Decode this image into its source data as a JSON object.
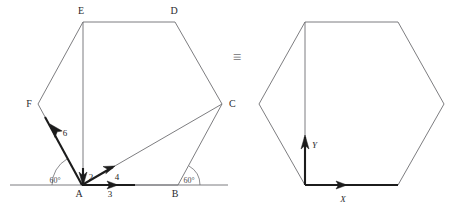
{
  "figure": {
    "equivalence_symbol": "≡",
    "colors": {
      "polygon_stroke": "#6e6e72",
      "vector_stroke": "#1c1c1c",
      "background": "#ffffff",
      "label_text": "#2a2a2e"
    },
    "left_diagram": {
      "name": "labelled-hexagon-with-vectors",
      "vertices": [
        {
          "label": "A",
          "x": 82,
          "y": 185,
          "label_x": 79,
          "label_y": 197
        },
        {
          "label": "B",
          "x": 178,
          "y": 185,
          "label_x": 175,
          "label_y": 197
        },
        {
          "label": "C",
          "x": 222,
          "y": 104,
          "label_x": 227,
          "label_y": 106
        },
        {
          "label": "D",
          "x": 175,
          "y": 22,
          "label_x": 172,
          "label_y": 14
        },
        {
          "label": "E",
          "x": 83,
          "y": 22,
          "label_x": 79,
          "label_y": 14
        },
        {
          "label": "F",
          "x": 38,
          "y": 104,
          "label_x": 26,
          "label_y": 107
        }
      ],
      "baseline": {
        "x1": 10,
        "y1": 185,
        "x2": 228,
        "y2": 185
      },
      "angles": [
        {
          "label": "60°",
          "at_vertex": "A",
          "label_x": 55,
          "label_y": 182
        },
        {
          "label": "60°",
          "at_vertex": "B",
          "label_x": 181,
          "label_y": 182
        }
      ],
      "vectors": [
        {
          "name": "vector-AB",
          "magnitude": "3",
          "from": "A",
          "to": "toward B",
          "label_x": 110,
          "label_y": 196
        },
        {
          "name": "vector-AC",
          "magnitude": "4",
          "from": "A",
          "to": "toward C",
          "label_x": 116,
          "label_y": 179
        },
        {
          "name": "vector-AE",
          "magnitude": "2",
          "from": "E",
          "to": "A",
          "label_x": 89,
          "label_y": 178
        },
        {
          "name": "vector-AF",
          "magnitude": "6",
          "from": "A",
          "to": "toward F",
          "label_x": 64,
          "label_y": 136
        }
      ]
    },
    "right_diagram": {
      "name": "plain-hexagon-with-axes",
      "vertices": [
        {
          "x": 305,
          "y": 185
        },
        {
          "x": 398,
          "y": 185
        },
        {
          "x": 444,
          "y": 104
        },
        {
          "x": 398,
          "y": 22
        },
        {
          "x": 305,
          "y": 22
        },
        {
          "x": 259,
          "y": 104
        }
      ],
      "origin": {
        "x": 305,
        "y": 185
      },
      "axes": [
        {
          "label": "X",
          "name": "x-axis",
          "label_x": 341,
          "label_y": 201,
          "tip_x": 398,
          "tip_y": 185
        },
        {
          "label": "Y",
          "name": "y-axis",
          "label_x": 311,
          "label_y": 145,
          "tip_x": 305,
          "tip_y": 135
        }
      ]
    }
  }
}
